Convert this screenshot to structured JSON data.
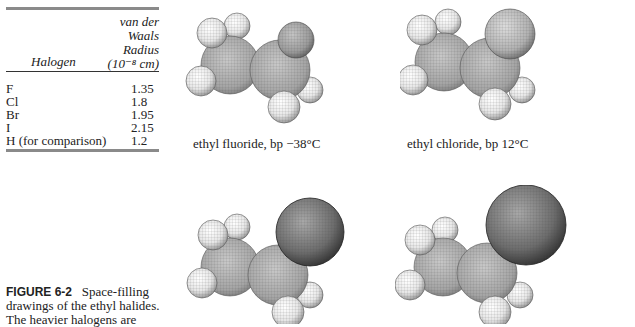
{
  "table": {
    "header": {
      "col1": "Halogen",
      "col2_lines": [
        "van der",
        "Waals",
        "Radius",
        "(10⁻⁸ cm)"
      ]
    },
    "rows": [
      {
        "halogen": "F",
        "radius": "1.35"
      },
      {
        "halogen": "Cl",
        "radius": "1.8"
      },
      {
        "halogen": "Br",
        "radius": "1.95"
      },
      {
        "halogen": "I",
        "radius": "2.15"
      },
      {
        "halogen": "H (for comparison)",
        "radius": "1.2"
      }
    ]
  },
  "molecules": [
    {
      "name": "ethyl-fluoride",
      "caption": "ethyl fluoride, bp −38°C",
      "halogen_radius": 17,
      "halogen_color": "#9a9a9a"
    },
    {
      "name": "ethyl-chloride",
      "caption": "ethyl chloride, bp 12°C",
      "halogen_radius": 22,
      "halogen_color": "#a8a8a8"
    },
    {
      "name": "ethyl-bromide",
      "caption": "",
      "halogen_radius": 30,
      "halogen_color": "#6e6e6e"
    },
    {
      "name": "ethyl-iodide",
      "caption": "",
      "halogen_radius": 34,
      "halogen_color": "#707070"
    }
  ],
  "figure_caption": {
    "label": "FIGURE 6-2",
    "line1_rest": "Space-filling",
    "line2": "drawings of the ethyl halides.",
    "line3": "The heavier halogens are"
  }
}
